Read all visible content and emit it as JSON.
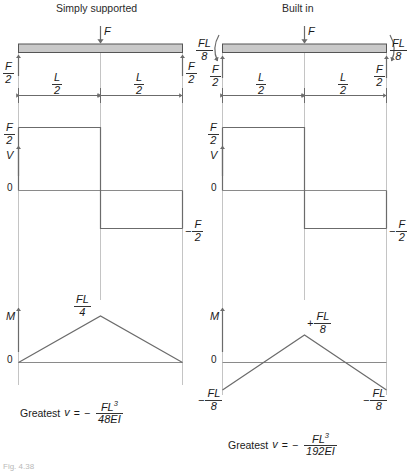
{
  "figure": {
    "caption": "Fig. 4.38",
    "panels": [
      {
        "id": "simply-supported",
        "title": "Simply supported",
        "load_label": "F",
        "reaction_left": {
          "num": "F",
          "den": "2"
        },
        "reaction_right": {
          "num": "F",
          "den": "2"
        },
        "span_left": {
          "num": "L",
          "den": "2"
        },
        "span_right": {
          "num": "L",
          "den": "2"
        },
        "end_moments": null,
        "shear": {
          "axis_label": "V",
          "zero_label": "0",
          "top_label": {
            "sign": "",
            "num": "F",
            "den": "2"
          },
          "bottom_label": {
            "sign": "−",
            "num": "F",
            "den": "2"
          },
          "values": [
            0.5,
            0.5,
            -0.5,
            -0.5
          ],
          "x": [
            0,
            0.5,
            0.5,
            1
          ]
        },
        "moment": {
          "axis_label": "M",
          "zero_label": "0",
          "peak_label": {
            "sign": "",
            "num": "FL",
            "den": "4"
          },
          "end_labels": null,
          "values": [
            0,
            0.25,
            0
          ],
          "x": [
            0,
            0.5,
            1
          ]
        },
        "deflection": {
          "prefix": "Greatest",
          "variable": "v",
          "equals": "=",
          "sign": "−",
          "num": "FL",
          "num_exp": "3",
          "den": "48EI"
        }
      },
      {
        "id": "built-in",
        "title": "Built in",
        "load_label": "F",
        "reaction_left": {
          "num": "F",
          "den": "2"
        },
        "reaction_right": {
          "num": "F",
          "den": "2"
        },
        "span_left": {
          "num": "L",
          "den": "2"
        },
        "span_right": {
          "num": "L",
          "den": "2"
        },
        "end_moments": {
          "left": {
            "num": "FL",
            "den": "8"
          },
          "right": {
            "num": "FL",
            "den": "8"
          }
        },
        "shear": {
          "axis_label": "V",
          "zero_label": "0",
          "top_label": {
            "sign": "",
            "num": "F",
            "den": "2"
          },
          "bottom_label": {
            "sign": "−",
            "num": "F",
            "den": "2"
          },
          "values": [
            0.5,
            0.5,
            -0.5,
            -0.5
          ],
          "x": [
            0,
            0.5,
            0.5,
            1
          ]
        },
        "moment": {
          "axis_label": "M",
          "zero_label": "0",
          "peak_label": {
            "sign": "+",
            "num": "FL",
            "den": "8"
          },
          "end_labels": {
            "left": {
              "sign": "−",
              "num": "FL",
              "den": "8"
            },
            "right": {
              "sign": "−",
              "num": "FL",
              "den": "8"
            }
          },
          "values": [
            -0.125,
            0.125,
            -0.125
          ],
          "x": [
            0,
            0.5,
            1
          ],
          "zero_crossings": [
            0.25,
            0.75
          ]
        },
        "deflection": {
          "prefix": "Greatest",
          "variable": "v",
          "equals": "=",
          "sign": "−",
          "num": "FL",
          "num_exp": "3",
          "den": "192EI"
        }
      }
    ],
    "colors": {
      "beam_fill": "#c9c9c9",
      "beam_stroke": "#555555",
      "curve": "#666666",
      "guide": "#c4c4c4",
      "text": "#1a1a1a"
    }
  }
}
